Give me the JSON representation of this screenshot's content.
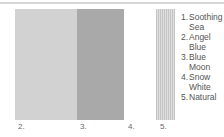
{
  "swatches": [
    {
      "number": "2.",
      "color": "#d2d2d2"
    },
    {
      "number": "3.",
      "color": "#a9a9a9"
    },
    {
      "number": "4.",
      "color": "#ffffff"
    },
    {
      "number": "5.",
      "color": "#cfcfcf",
      "pattern": "vertical-stripes"
    }
  ],
  "legend": [
    {
      "num": "1.",
      "name": "Soothing Sea"
    },
    {
      "num": "2.",
      "name": "Angel Blue"
    },
    {
      "num": "3.",
      "name": "Blue Moon"
    },
    {
      "num": "4.",
      "name": "Snow White"
    },
    {
      "num": "5.",
      "name": "Natural"
    }
  ]
}
